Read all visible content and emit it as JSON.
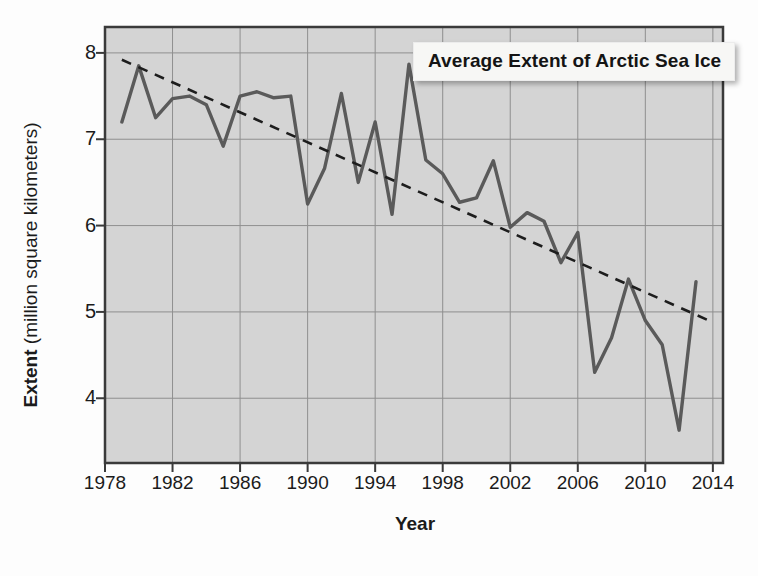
{
  "chart_data": {
    "type": "line",
    "title": "Average Extent of Arctic Sea Ice",
    "xlabel": "Year",
    "ylabel_bold": "Extent",
    "ylabel_rest": " (million square kilometers)",
    "ylabel": "Extent (million square kilometers)",
    "xlim": [
      1978,
      2014.6
    ],
    "ylim": [
      3.25,
      8.3
    ],
    "xticks": [
      1978,
      1982,
      1986,
      1990,
      1994,
      1998,
      2002,
      2006,
      2010,
      2014
    ],
    "xtick_labels": [
      "1978",
      "1982",
      "1986",
      "1990",
      "1994",
      "1998",
      "2002",
      "2006",
      "2010",
      "2014"
    ],
    "yticks": [
      4,
      5,
      6,
      7,
      8
    ],
    "ytick_labels": [
      "4",
      "5",
      "6",
      "7",
      "8"
    ],
    "grid": true,
    "legend": "none",
    "series": [
      {
        "name": "Average extent of Arctic sea ice",
        "kind": "line",
        "color": "#5a5a5a",
        "x": [
          1979,
          1980,
          1981,
          1982,
          1983,
          1984,
          1985,
          1986,
          1987,
          1988,
          1989,
          1990,
          1991,
          1992,
          1993,
          1994,
          1995,
          1996,
          1997,
          1998,
          1999,
          2000,
          2001,
          2002,
          2003,
          2004,
          2005,
          2006,
          2007,
          2008,
          2009,
          2010,
          2011,
          2012,
          2013
        ],
        "values": [
          7.2,
          7.85,
          7.25,
          7.47,
          7.5,
          7.4,
          6.92,
          7.5,
          7.55,
          7.48,
          7.5,
          6.25,
          6.66,
          7.53,
          6.5,
          7.2,
          6.13,
          7.87,
          6.76,
          6.6,
          6.27,
          6.32,
          6.75,
          5.98,
          6.15,
          6.05,
          5.57,
          5.92,
          4.3,
          4.7,
          5.38,
          4.9,
          4.62,
          3.63,
          5.35
        ]
      },
      {
        "name": "Linear trend",
        "kind": "dashed-trend",
        "color": "#1d1d1d",
        "x": [
          1979,
          2014
        ],
        "values": [
          7.92,
          4.88
        ]
      }
    ],
    "notes": [
      "Data line shows a declining, highly variable series from about 7.2 in 1979 to about 3.6 in 2012.",
      "A dashed straight trend line runs from about 7.9 (1979) down to about 4.9 (2014)."
    ]
  },
  "title_box": {
    "label": "Average Extent of Arctic Sea Ice"
  },
  "axes": {
    "x_title": "Year",
    "y_title_bold": "Extent",
    "y_title_rest": " (million square kilometers)"
  },
  "colors": {
    "plot_background": "#d4d4d4",
    "grid": "#8f8f8f",
    "axis": "#3a3a3a",
    "data_line": "#5a5a5a",
    "trend_line": "#1f1f1f",
    "text": "#1b1b1b",
    "title_box_background": "#f7f7f5"
  }
}
